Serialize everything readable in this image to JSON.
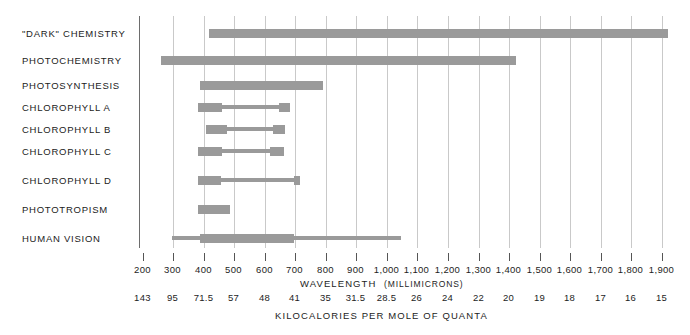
{
  "chart_data": {
    "type": "bar",
    "title": "",
    "subtitle": "",
    "orientation": "horizontal",
    "xlabel": "WAVELENGTH",
    "xlabel_unit": "(MILLIMICRONS)",
    "xlabel2": "KILOCALORIES PER MOLE OF QUANTA",
    "xlim": [
      150,
      1950
    ],
    "grid": true,
    "legend": "none",
    "bar_color": "#9a9a9a",
    "x_ticks": [
      {
        "label": "200",
        "value": 200
      },
      {
        "label": "300",
        "value": 300
      },
      {
        "label": "400",
        "value": 400
      },
      {
        "label": "500",
        "value": 500
      },
      {
        "label": "600",
        "value": 600
      },
      {
        "label": "700",
        "value": 700
      },
      {
        "label": "800",
        "value": 800
      },
      {
        "label": "900",
        "value": 900
      },
      {
        "label": "1,000",
        "value": 1000
      },
      {
        "label": "1,100",
        "value": 1100
      },
      {
        "label": "1,200",
        "value": 1200
      },
      {
        "label": "1,300",
        "value": 1300
      },
      {
        "label": "1,400",
        "value": 1400
      },
      {
        "label": "1,500",
        "value": 1500
      },
      {
        "label": "1,600",
        "value": 1600
      },
      {
        "label": "1,700",
        "value": 1700
      },
      {
        "label": "1,800",
        "value": 1800
      },
      {
        "label": "1,900",
        "value": 1900
      }
    ],
    "x_ticks_secondary": [
      {
        "label": "143",
        "value": 200
      },
      {
        "label": "95",
        "value": 300
      },
      {
        "label": "71.5",
        "value": 400
      },
      {
        "label": "57",
        "value": 500
      },
      {
        "label": "48",
        "value": 600
      },
      {
        "label": "41",
        "value": 700
      },
      {
        "label": "35",
        "value": 800
      },
      {
        "label": "31.5",
        "value": 900
      },
      {
        "label": "28.5",
        "value": 1000
      },
      {
        "label": "26",
        "value": 1100
      },
      {
        "label": "24",
        "value": 1200
      },
      {
        "label": "22",
        "value": 1300
      },
      {
        "label": "20",
        "value": 1400
      },
      {
        "label": "19",
        "value": 1500
      },
      {
        "label": "18",
        "value": 1600
      },
      {
        "label": "17",
        "value": 1700
      },
      {
        "label": "16",
        "value": 1800
      },
      {
        "label": "15",
        "value": 1900
      }
    ],
    "categories": [
      "\"DARK\" CHEMISTRY",
      "PHOTOCHEMISTRY",
      "PHOTOSYNTHESIS",
      "CHLOROPHYLL A",
      "CHLOROPHYLL B",
      "CHLOROPHYLL C",
      "CHLOROPHYLL D",
      "PHOTOTROPISM",
      "HUMAN VISION"
    ],
    "series": [
      {
        "name": "\"DARK\" CHEMISTRY",
        "row": 0,
        "segments": [
          {
            "start": 420,
            "end": 1925,
            "weight": "thick"
          }
        ]
      },
      {
        "name": "PHOTOCHEMISTRY",
        "row": 1,
        "segments": [
          {
            "start": 265,
            "end": 1425,
            "weight": "thick"
          }
        ]
      },
      {
        "name": "PHOTOSYNTHESIS",
        "row": 2,
        "segments": [
          {
            "start": 390,
            "end": 795,
            "weight": "thick"
          }
        ]
      },
      {
        "name": "CHLOROPHYLL A",
        "row": 3,
        "segments": [
          {
            "start": 385,
            "end": 465,
            "weight": "thick"
          },
          {
            "start": 465,
            "end": 650,
            "weight": "thin"
          },
          {
            "start": 650,
            "end": 685,
            "weight": "thick"
          }
        ]
      },
      {
        "name": "CHLOROPHYLL B",
        "row": 4,
        "segments": [
          {
            "start": 410,
            "end": 480,
            "weight": "thick"
          },
          {
            "start": 480,
            "end": 630,
            "weight": "thin"
          },
          {
            "start": 630,
            "end": 670,
            "weight": "thick"
          }
        ]
      },
      {
        "name": "CHLOROPHYLL C",
        "row": 5,
        "segments": [
          {
            "start": 385,
            "end": 465,
            "weight": "thick"
          },
          {
            "start": 465,
            "end": 620,
            "weight": "thin"
          },
          {
            "start": 620,
            "end": 665,
            "weight": "thick"
          }
        ]
      },
      {
        "name": "CHLOROPHYLL D",
        "row": 6,
        "segments": [
          {
            "start": 385,
            "end": 460,
            "weight": "thick"
          },
          {
            "start": 460,
            "end": 700,
            "weight": "thin"
          },
          {
            "start": 700,
            "end": 720,
            "weight": "thick"
          }
        ]
      },
      {
        "name": "PHOTOTROPISM",
        "row": 7,
        "segments": [
          {
            "start": 385,
            "end": 490,
            "weight": "thick"
          }
        ]
      },
      {
        "name": "HUMAN VISION",
        "row": 8,
        "segments": [
          {
            "start": 300,
            "end": 390,
            "weight": "thin"
          },
          {
            "start": 390,
            "end": 700,
            "weight": "thick"
          },
          {
            "start": 700,
            "end": 1050,
            "weight": "thin"
          }
        ]
      }
    ]
  }
}
